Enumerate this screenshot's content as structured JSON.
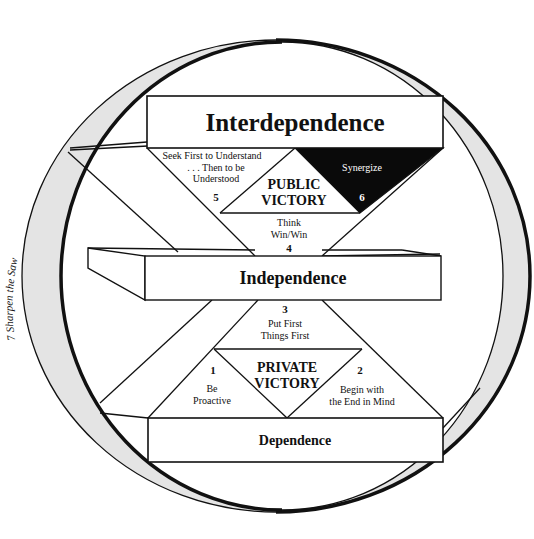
{
  "diagram": {
    "stages": {
      "top": "Interdependence",
      "middle": "Independence",
      "bottom": "Dependence"
    },
    "victories": {
      "public": [
        "PUBLIC",
        "VICTORY"
      ],
      "private": [
        "PRIVATE",
        "VICTORY"
      ]
    },
    "habits": [
      {
        "number": "1",
        "lines": [
          "Be",
          "Proactive"
        ]
      },
      {
        "number": "2",
        "lines": [
          "Begin with",
          "the End in Mind"
        ]
      },
      {
        "number": "3",
        "lines": [
          "Put First",
          "Things First"
        ]
      },
      {
        "number": "4",
        "lines": [
          "Think",
          "Win/Win"
        ]
      },
      {
        "number": "5",
        "lines": [
          "Seek First to Understand",
          ". . . Then to be",
          "Understood"
        ]
      },
      {
        "number": "6",
        "lines": [
          "Synergize"
        ]
      },
      {
        "number": "7",
        "lines": [
          "Sharpen the Saw"
        ]
      }
    ],
    "ring_label": "7  Sharpen the Saw",
    "colors": {
      "line": "#111111",
      "ring_fill": "#e4e4e4",
      "synergize_fill": "#0a0a0a",
      "synergize_text": "#ffffff",
      "background": "#ffffff"
    }
  }
}
